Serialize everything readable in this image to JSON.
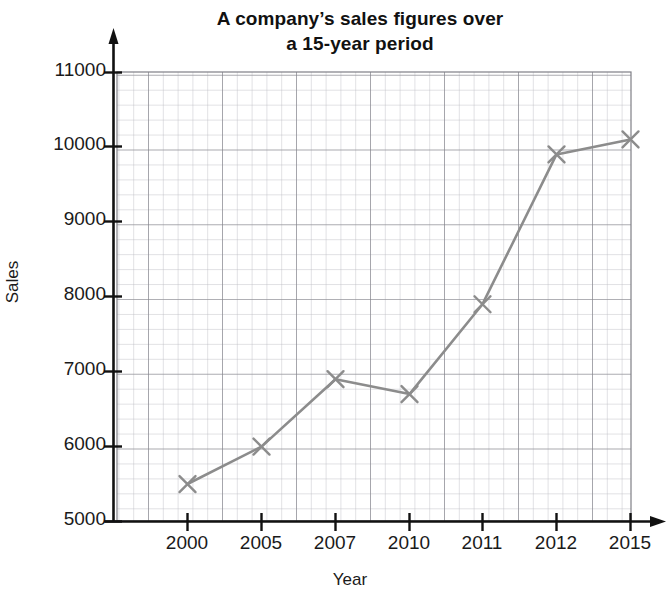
{
  "chart_data": {
    "type": "line",
    "title": "A company’s sales figures over a 15-year period",
    "title_line1": "A company’s sales figures over",
    "title_line2": "a 15-year period",
    "xlabel": "Year",
    "ylabel": "Sales",
    "categories": [
      "2000",
      "2005",
      "2007",
      "2010",
      "2011",
      "2012",
      "2015"
    ],
    "x": [
      2000,
      2005,
      2007,
      2010,
      2011,
      2012,
      2015
    ],
    "values": [
      5500,
      6000,
      6900,
      6700,
      7900,
      9900,
      10100
    ],
    "ylim": [
      5000,
      11000
    ],
    "ytick_labels": [
      "11000",
      "10000",
      "9000",
      "8000",
      "7000",
      "6000",
      "5000"
    ],
    "yticks": [
      11000,
      10000,
      9000,
      8000,
      7000,
      6000,
      5000
    ],
    "ytick_step": 1000,
    "xtick_labels": [
      "2000",
      "2005",
      "2007",
      "2010",
      "2011",
      "2012",
      "2015"
    ],
    "grid": "on",
    "grid_minor": "on",
    "legend": "none",
    "marker": "x",
    "series_color": "#8c8c8c",
    "grid_color": "#9a9aa0",
    "axis_color": "#111111",
    "background": "#ffffff"
  }
}
